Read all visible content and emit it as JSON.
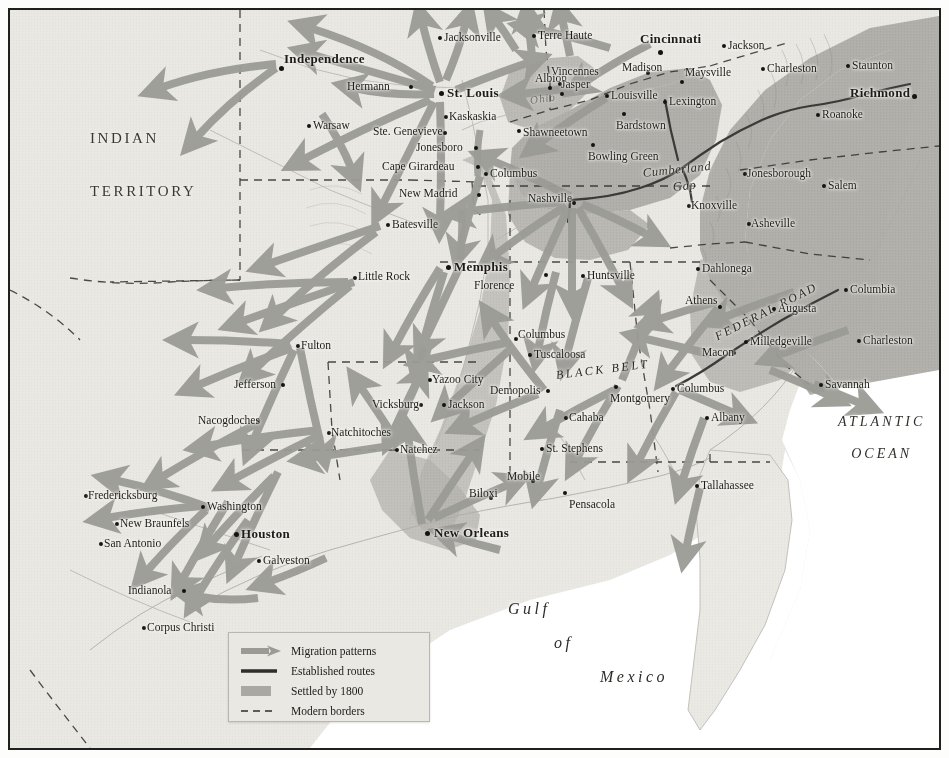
{
  "map": {
    "title": "Antebellum Migration Patterns of the American South",
    "regions": [
      {
        "name": "INDIAN TERRITORY",
        "line1": "INDIAN",
        "line2": "TERRITORY",
        "x": 88,
        "y": 128
      }
    ],
    "oceans": [
      {
        "name": "ATLANTIC OCEAN",
        "line1": "ATLANTIC",
        "line2": "OCEAN",
        "x": 840,
        "y": 412
      },
      {
        "name": "Gulf of Mexico",
        "line1": "Gulf",
        "line2": "of",
        "line3": "Mexico",
        "x": 505,
        "y": 598
      }
    ],
    "features": [
      {
        "label": "Ohio",
        "x": 520,
        "y": 84,
        "size": 11,
        "rotate": -8,
        "spacing": 1,
        "opacity": 0.5
      },
      {
        "label": "Cumberland",
        "x": 633,
        "y": 156,
        "size": 12.5,
        "rotate": -6,
        "spacing": 0.6,
        "opacity": 0.95
      },
      {
        "label": "Gap",
        "x": 663,
        "y": 170,
        "size": 12.5,
        "rotate": -6,
        "spacing": 0.6,
        "opacity": 0.95
      },
      {
        "label": "BLACK BELT",
        "x": 546,
        "y": 358,
        "size": 12,
        "rotate": -7,
        "spacing": 2.6,
        "opacity": 1
      },
      {
        "label": "FEDERAL ROAD",
        "x": 706,
        "y": 320,
        "size": 12,
        "rotate": -27,
        "spacing": 2.2,
        "opacity": 1
      }
    ],
    "cities": [
      {
        "name": "Independence",
        "x": 274,
        "y": 42,
        "dx": -4,
        "dy": 0,
        "major": true,
        "anchor": "right",
        "px": 269,
        "py": 56
      },
      {
        "name": "Hermann",
        "x": 337,
        "y": 71,
        "anchor": "right",
        "px": 399,
        "py": 75
      },
      {
        "name": "Warsaw",
        "x": 303,
        "y": 110,
        "anchor": "left",
        "px": 297,
        "py": 114
      },
      {
        "name": "St. Louis",
        "x": 437,
        "y": 76,
        "major": true,
        "anchor": "left",
        "px": 429,
        "py": 81
      },
      {
        "name": "Ste. Genevieve",
        "x": 363,
        "y": 116,
        "anchor": "right",
        "px": 433,
        "py": 121
      },
      {
        "name": "Kaskaskia",
        "x": 439,
        "y": 101,
        "anchor": "left",
        "px": 434,
        "py": 105
      },
      {
        "name": "Jonesboro",
        "x": 406,
        "y": 132,
        "anchor": "right",
        "px": 464,
        "py": 136
      },
      {
        "name": "Cape Girardeau",
        "x": 372,
        "y": 151,
        "anchor": "right",
        "px": 466,
        "py": 155
      },
      {
        "name": "New Madrid",
        "x": 389,
        "y": 178,
        "anchor": "right",
        "px": 467,
        "py": 183
      },
      {
        "name": "Columbus",
        "x": 480,
        "y": 158,
        "anchor": "left",
        "px": 474,
        "py": 162
      },
      {
        "name": "Batesville",
        "x": 382,
        "y": 209,
        "anchor": "left",
        "px": 376,
        "py": 213
      },
      {
        "name": "Little Rock",
        "x": 348,
        "y": 261,
        "anchor": "left",
        "px": 343,
        "py": 266
      },
      {
        "name": "Memphis",
        "x": 444,
        "y": 250,
        "major": true,
        "anchor": "left",
        "px": 436,
        "py": 255
      },
      {
        "name": "Jacksonville",
        "x": 434,
        "y": 22,
        "anchor": "left",
        "px": 428,
        "py": 26
      },
      {
        "name": "Terre Haute",
        "x": 528,
        "y": 20,
        "anchor": "left",
        "px": 522,
        "py": 24
      },
      {
        "name": "Albion",
        "x": 525,
        "y": 63,
        "anchor": "right",
        "px": 538,
        "py": 76
      },
      {
        "name": "Vincennes",
        "x": 541,
        "y": 56,
        "anchor": "left",
        "px": 548,
        "py": 72
      },
      {
        "name": "Jasper",
        "x": 551,
        "y": 69,
        "anchor": "left",
        "px": 550,
        "py": 82
      },
      {
        "name": "Shawneetown",
        "x": 513,
        "y": 117,
        "anchor": "left",
        "px": 507,
        "py": 119
      },
      {
        "name": "Cincinnati",
        "x": 630,
        "y": 22,
        "major": true,
        "anchor": "left",
        "px": 648,
        "py": 40
      },
      {
        "name": "Jackson",
        "x": 718,
        "y": 30,
        "anchor": "left",
        "px": 712,
        "py": 34
      },
      {
        "name": "Madison",
        "x": 612,
        "y": 52,
        "anchor": "left",
        "px": 636,
        "py": 61
      },
      {
        "name": "Maysville",
        "x": 675,
        "y": 57,
        "anchor": "left",
        "px": 670,
        "py": 70
      },
      {
        "name": "Charleston",
        "x": 757,
        "y": 53,
        "anchor": "left",
        "px": 751,
        "py": 57
      },
      {
        "name": "Staunton",
        "x": 842,
        "y": 50,
        "anchor": "left",
        "px": 836,
        "py": 54
      },
      {
        "name": "Richmond",
        "x": 840,
        "y": 76,
        "major": true,
        "anchor": "left",
        "px": 902,
        "py": 84
      },
      {
        "name": "Louisville",
        "x": 601,
        "y": 80,
        "anchor": "left",
        "px": 595,
        "py": 84
      },
      {
        "name": "Lexington",
        "x": 659,
        "y": 86,
        "anchor": "left",
        "px": 653,
        "py": 90
      },
      {
        "name": "Bardstown",
        "x": 606,
        "y": 110,
        "anchor": "left",
        "px": 612,
        "py": 102
      },
      {
        "name": "Roanoke",
        "x": 812,
        "y": 99,
        "anchor": "left",
        "px": 806,
        "py": 103
      },
      {
        "name": "Bowling Green",
        "x": 578,
        "y": 141,
        "anchor": "left",
        "px": 581,
        "py": 133
      },
      {
        "name": "Nashville",
        "x": 518,
        "y": 183,
        "anchor": "right",
        "px": 562,
        "py": 191
      },
      {
        "name": "Jonesborough",
        "x": 737,
        "y": 158,
        "anchor": "left",
        "px": 733,
        "py": 162
      },
      {
        "name": "Salem",
        "x": 818,
        "y": 170,
        "anchor": "left",
        "px": 812,
        "py": 174
      },
      {
        "name": "Knoxville",
        "x": 681,
        "y": 190,
        "anchor": "left",
        "px": 677,
        "py": 194
      },
      {
        "name": "Asheville",
        "x": 741,
        "y": 208,
        "anchor": "left",
        "px": 737,
        "py": 212
      },
      {
        "name": "Dahlonega",
        "x": 692,
        "y": 253,
        "anchor": "left",
        "px": 686,
        "py": 257
      },
      {
        "name": "Florence",
        "x": 464,
        "y": 270,
        "anchor": "left",
        "px": 534,
        "py": 263
      },
      {
        "name": "Huntsville",
        "x": 577,
        "y": 260,
        "anchor": "left",
        "px": 571,
        "py": 264
      },
      {
        "name": "Columbia",
        "x": 840,
        "y": 274,
        "anchor": "left",
        "px": 834,
        "py": 278
      },
      {
        "name": "Athens",
        "x": 675,
        "y": 285,
        "anchor": "left",
        "px": 708,
        "py": 295
      },
      {
        "name": "Augusta",
        "x": 768,
        "y": 293,
        "anchor": "left",
        "px": 762,
        "py": 297
      },
      {
        "name": "Columbus",
        "x": 508,
        "y": 319,
        "anchor": "left",
        "px": 504,
        "py": 327
      },
      {
        "name": "Tuscaloosa",
        "x": 524,
        "y": 339,
        "anchor": "left",
        "px": 518,
        "py": 343
      },
      {
        "name": "Charleston",
        "x": 853,
        "y": 325,
        "anchor": "left",
        "px": 847,
        "py": 329
      },
      {
        "name": "Milledgeville",
        "x": 740,
        "y": 326,
        "anchor": "left",
        "px": 734,
        "py": 330
      },
      {
        "name": "Macon",
        "x": 692,
        "y": 337,
        "anchor": "left",
        "px": 722,
        "py": 341
      },
      {
        "name": "Fulton",
        "x": 291,
        "y": 330,
        "anchor": "left",
        "px": 286,
        "py": 334
      },
      {
        "name": "Jefferson",
        "x": 224,
        "y": 369,
        "anchor": "left",
        "px": 271,
        "py": 373
      },
      {
        "name": "Yazoo City",
        "x": 422,
        "y": 364,
        "anchor": "left",
        "px": 418,
        "py": 368
      },
      {
        "name": "Vicksburg",
        "x": 362,
        "y": 389,
        "anchor": "left",
        "px": 409,
        "py": 393
      },
      {
        "name": "Jackson",
        "x": 438,
        "y": 389,
        "anchor": "left",
        "px": 432,
        "py": 393
      },
      {
        "name": "Demopolis",
        "x": 480,
        "y": 375,
        "anchor": "left",
        "px": 536,
        "py": 379
      },
      {
        "name": "Montgomery",
        "x": 600,
        "y": 383,
        "anchor": "left",
        "px": 604,
        "py": 375
      },
      {
        "name": "Columbus",
        "x": 667,
        "y": 373,
        "anchor": "left",
        "px": 661,
        "py": 377
      },
      {
        "name": "Savannah",
        "x": 815,
        "y": 369,
        "anchor": "left",
        "px": 809,
        "py": 373
      },
      {
        "name": "Cahaba",
        "x": 559,
        "y": 402,
        "anchor": "left",
        "px": 554,
        "py": 406
      },
      {
        "name": "Albany",
        "x": 701,
        "y": 402,
        "anchor": "left",
        "px": 695,
        "py": 406
      },
      {
        "name": "Nacogdoches",
        "x": 188,
        "y": 405,
        "anchor": "left",
        "px": 246,
        "py": 409
      },
      {
        "name": "Natchitoches",
        "x": 321,
        "y": 417,
        "anchor": "left",
        "px": 317,
        "py": 421
      },
      {
        "name": "St. Stephens",
        "x": 536,
        "y": 433,
        "anchor": "left",
        "px": 530,
        "py": 437
      },
      {
        "name": "Natchez",
        "x": 390,
        "y": 434,
        "anchor": "left",
        "px": 385,
        "py": 438
      },
      {
        "name": "Mobile",
        "x": 497,
        "y": 461,
        "anchor": "left",
        "px": 521,
        "py": 469
      },
      {
        "name": "Tallahassee",
        "x": 691,
        "y": 470,
        "anchor": "left",
        "px": 685,
        "py": 474
      },
      {
        "name": "Biloxi",
        "x": 459,
        "y": 478,
        "anchor": "left",
        "px": 479,
        "py": 486
      },
      {
        "name": "Pensacola",
        "x": 559,
        "y": 489,
        "anchor": "left",
        "px": 553,
        "py": 481
      },
      {
        "name": "Fredericksburg",
        "x": 78,
        "y": 480,
        "anchor": "left",
        "px": 74,
        "py": 484
      },
      {
        "name": "Washington",
        "x": 197,
        "y": 491,
        "anchor": "left",
        "px": 191,
        "py": 495
      },
      {
        "name": "New Braunfels",
        "x": 110,
        "y": 508,
        "anchor": "left",
        "px": 105,
        "py": 512
      },
      {
        "name": "Houston",
        "x": 231,
        "y": 517,
        "major": true,
        "anchor": "left",
        "px": 224,
        "py": 522
      },
      {
        "name": "San Antonio",
        "x": 94,
        "y": 528,
        "anchor": "left",
        "px": 89,
        "py": 532
      },
      {
        "name": "Galveston",
        "x": 253,
        "y": 545,
        "anchor": "left",
        "px": 247,
        "py": 549
      },
      {
        "name": "New Orleans",
        "x": 424,
        "y": 516,
        "major": true,
        "anchor": "left",
        "px": 415,
        "py": 521
      },
      {
        "name": "Indianola",
        "x": 118,
        "y": 575,
        "anchor": "left",
        "px": 172,
        "py": 579
      },
      {
        "name": "Corpus Christi",
        "x": 137,
        "y": 612,
        "anchor": "left",
        "px": 132,
        "py": 616
      }
    ],
    "legend": {
      "items": [
        {
          "key": "arrow",
          "label": "Migration patterns"
        },
        {
          "key": "line",
          "label": "Established routes"
        },
        {
          "key": "swatch",
          "label": "Settled by 1800"
        },
        {
          "key": "dashed",
          "label": "Modern borders"
        }
      ]
    },
    "colors": {
      "arrow": "#9b9b96",
      "settled": "#a9a8a2",
      "route": "#3a3a38",
      "border_dash": "#2e2e2c",
      "land": "#e7e6e0",
      "ocean": "#ffffff",
      "frame": "#20201e"
    }
  }
}
